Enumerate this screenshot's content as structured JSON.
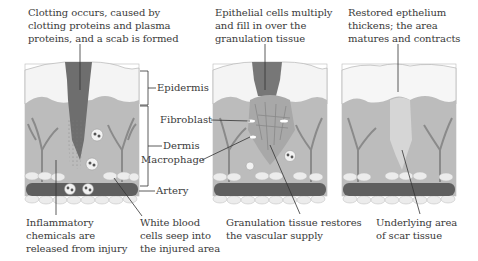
{
  "panels": [
    {
      "id": "stage-1",
      "caption_top": [
        "Clotting occurs, caused by",
        "clotting proteins and plasma",
        "proteins, and a scab is formed"
      ],
      "caption_bottom_left": [
        "Inflammatory",
        "chemicals are",
        "released from injury"
      ],
      "caption_bottom_right": [
        "White blood",
        "cells seep into",
        "the injured area"
      ]
    },
    {
      "id": "stage-2",
      "caption_top": [
        "Epithelial cells multiply",
        "and fill in over the",
        "granulation tissue"
      ],
      "caption_bottom": [
        "Granulation tissue restores",
        "the vascular supply"
      ]
    },
    {
      "id": "stage-3",
      "caption_top": [
        "Restored epthelium",
        "thickens; the area",
        "matures and contracts"
      ],
      "caption_bottom": [
        "Underlying area",
        "of scar tissue"
      ]
    }
  ],
  "labels": {
    "epidermis": "Epidermis",
    "dermis": "Dermis",
    "artery": "Artery",
    "fibroblast": "Fibroblast",
    "macrophage": "Macrophage"
  },
  "colors": {
    "epidermis": "#f4f4f4",
    "dermis": "#b9b9b9",
    "scab": "#6e6e6e",
    "vessel": "#8a8a8a",
    "artery": "#5a5a5a",
    "fat": "#ececec",
    "text": "#3a3a3a"
  }
}
